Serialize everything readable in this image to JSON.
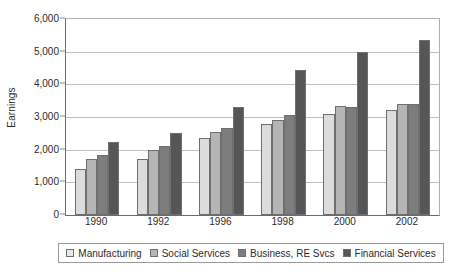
{
  "chart_data": {
    "type": "bar",
    "title": "",
    "subtitle": "",
    "xlabel": "",
    "ylabel": "Earnings",
    "categories": [
      "1990",
      "1992",
      "1996",
      "1998",
      "2000",
      "2002"
    ],
    "series": [
      {
        "name": "Manufacturing",
        "color": "#dcdcdc",
        "values": [
          1400,
          1700,
          2350,
          2800,
          3100,
          3200
        ]
      },
      {
        "name": "Social Services",
        "color": "#b5b5b5",
        "values": [
          1700,
          2000,
          2550,
          2900,
          3350,
          3400
        ]
      },
      {
        "name": "Business, RE Svcs",
        "color": "#7d7d7d",
        "values": [
          1850,
          2100,
          2650,
          3050,
          3300,
          3400
        ]
      },
      {
        "name": "Financial Services",
        "color": "#565656",
        "values": [
          2250,
          2500,
          3300,
          4450,
          5000,
          5350
        ]
      }
    ],
    "ylim": [
      0,
      6000
    ],
    "y_ticks": [
      0,
      1000,
      2000,
      3000,
      4000,
      5000,
      6000
    ],
    "y_tick_labels": [
      "0",
      "1,000",
      "2,000",
      "3,000",
      "4,000",
      "5,000",
      "6,000"
    ],
    "grid": true,
    "grid_axis": "y",
    "legend_position": "bottom",
    "legend_entries": [
      "Manufacturing",
      "Social Services",
      "Business, RE Svcs",
      "Financial Services"
    ]
  }
}
